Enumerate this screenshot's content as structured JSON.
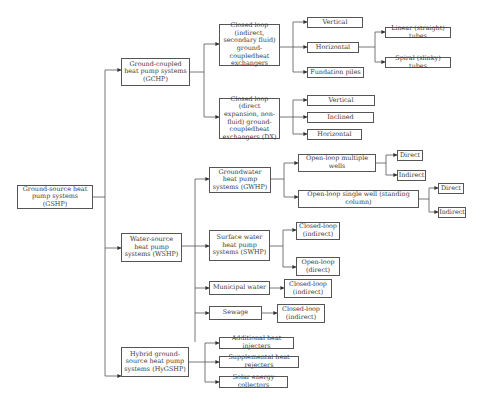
{
  "diagram": {
    "root": "Ground-source heat pump systems (GSHP)",
    "level1": {
      "gchp": "Ground-coupled heat pump systems (GCHP)",
      "wshp": "Water-source heat pump systems (WSHP)",
      "hygshp": "Hybrid ground-source heat pump systems (HyGSHP)"
    },
    "gchp_children": {
      "closed_indirect": "Closed loop (indirect, secondary fluid) ground-coupledheat exchangers",
      "closed_dx": "Closed loop (direct expansion, non-fluid) ground-coupledheat exchangers (DX)"
    },
    "closed_indirect_children": {
      "vertical": "Vertical",
      "horizontal": "Horizontal",
      "foundation": "Fundation piles"
    },
    "horizontal_children": {
      "linear": "Linear (straight) tubes",
      "spiral": "Spiral (slinky) tubes"
    },
    "closed_dx_children": {
      "vertical": "Vertical",
      "inclined": "Inclined",
      "horizontal": "Horizontal"
    },
    "wshp_children": {
      "gwhp": "Groundwater heat pump systems (GWHP)",
      "swhp": "Surface water heat pump systems (SWHP)",
      "municipal": "Municipal water",
      "sewage": "Sewage"
    },
    "gwhp_children": {
      "multiple": "Open-loop multiple wells",
      "single": "Open-loop single well (standing column)"
    },
    "multiple_children": {
      "direct": "Direct",
      "indirect": "Indirect"
    },
    "single_children": {
      "direct": "Direct",
      "indirect": "Indirect"
    },
    "swhp_children": {
      "closed": "Closed-loop (indirect)",
      "open": "Open-loop (direct)"
    },
    "municipal_child": "Closed-loop (indirect)",
    "sewage_child": "Closed-loop (indirect)",
    "hygshp_children": {
      "injectors": "Additional heat injecters",
      "rejecters": "Supplemental heat rejecters",
      "solar": "Solar energy collectors"
    }
  }
}
